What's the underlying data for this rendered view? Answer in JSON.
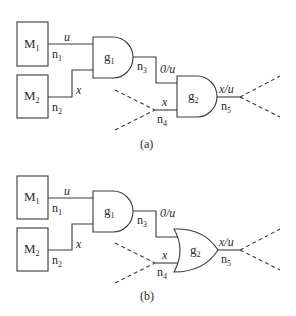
{
  "diagram": {
    "panels": [
      {
        "caption": "(a)",
        "modules": [
          {
            "name": "M",
            "sub": "1"
          },
          {
            "name": "M",
            "sub": "2"
          }
        ],
        "gates": [
          {
            "name": "g",
            "sub": "1",
            "type": "AND"
          },
          {
            "name": "g",
            "sub": "2",
            "type": "AND"
          }
        ],
        "nets": [
          {
            "name": "n",
            "sub": "1",
            "value": "u"
          },
          {
            "name": "n",
            "sub": "2",
            "value": "x"
          },
          {
            "name": "n",
            "sub": "3",
            "value": "0/u"
          },
          {
            "name": "n",
            "sub": "4",
            "value": "x"
          },
          {
            "name": "n",
            "sub": "5",
            "value": "x/u"
          }
        ]
      },
      {
        "caption": "(b)",
        "modules": [
          {
            "name": "M",
            "sub": "1"
          },
          {
            "name": "M",
            "sub": "2"
          }
        ],
        "gates": [
          {
            "name": "g",
            "sub": "1",
            "type": "AND"
          },
          {
            "name": "g",
            "sub": "2",
            "type": "OR"
          }
        ],
        "nets": [
          {
            "name": "n",
            "sub": "1",
            "value": "u"
          },
          {
            "name": "n",
            "sub": "2",
            "value": "x"
          },
          {
            "name": "n",
            "sub": "3",
            "value": "0/u"
          },
          {
            "name": "n",
            "sub": "4",
            "value": "x"
          },
          {
            "name": "n",
            "sub": "5",
            "value": "x/u"
          }
        ]
      }
    ]
  }
}
